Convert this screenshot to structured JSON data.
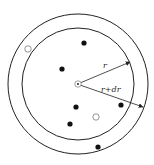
{
  "diagram": {
    "center": {
      "x": 78,
      "y": 84
    },
    "inner_circle": {
      "r": 56
    },
    "outer_circle": {
      "r": 70
    },
    "labels": {
      "inner_radius": "r",
      "outer_radius": "r+dr"
    },
    "filled_points": [
      {
        "x": 84,
        "y": 43
      },
      {
        "x": 62,
        "y": 69
      },
      {
        "x": 76,
        "y": 107
      },
      {
        "x": 121,
        "y": 105
      },
      {
        "x": 70,
        "y": 124
      },
      {
        "x": 98,
        "y": 147
      }
    ],
    "hollow_points": [
      {
        "x": 28,
        "y": 49
      },
      {
        "x": 96,
        "y": 117
      }
    ],
    "colors": {
      "stroke": "#222222",
      "fill": "#111111",
      "hollow_stroke": "#888888"
    }
  }
}
